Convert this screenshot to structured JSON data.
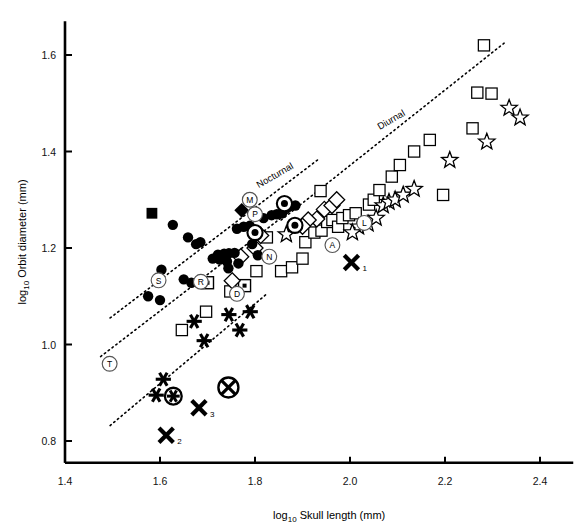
{
  "chart_data": {
    "type": "scatter",
    "title": "",
    "xlabel": "log10 Skull length (mm)",
    "xlabel_base": "log",
    "xlabel_sub": "10",
    "xlabel_rest": "Skull length (mm)",
    "ylabel_base": "log",
    "ylabel_sub": "10",
    "ylabel_rest": "Orbit diameter (mm)",
    "ylabel": "log10 Orbit diameter (mm)",
    "xlim": [
      1.4,
      2.47
    ],
    "ylim": [
      0.755,
      1.67
    ],
    "xticks": [
      1.4,
      1.6,
      1.8,
      2.0,
      2.2,
      2.4
    ],
    "xtick_labels": [
      "1.4",
      "1.6",
      "1.8",
      "2.0",
      "2.2",
      "2.4"
    ],
    "yticks": [
      0.8,
      1.0,
      1.2,
      1.4,
      1.6
    ],
    "ytick_labels": [
      "0.8",
      "1.0",
      "1.2",
      "1.4",
      "1.6"
    ],
    "grid": false,
    "legend": "none",
    "annotations": [
      {
        "text": "Diurnal",
        "x": 2.09,
        "y": 1.46,
        "rotation": -30
      },
      {
        "text": "Nocturnal",
        "x": 1.845,
        "y": 1.345,
        "rotation": -30
      }
    ],
    "trend_lines": [
      {
        "name": "upper-diurnal-line",
        "x0": 1.855,
        "y0": 1.258,
        "x1": 2.325,
        "y1": 1.625,
        "style": "dotted"
      },
      {
        "name": "middle-nocturnal-line",
        "x0": 1.495,
        "y0": 1.055,
        "x1": 1.935,
        "y1": 1.385,
        "style": "dotted"
      },
      {
        "name": "lower-line",
        "x0": 1.475,
        "y0": 0.975,
        "x1": 1.885,
        "y1": 1.285,
        "style": "dotted"
      },
      {
        "name": "bottom-line",
        "x0": 1.495,
        "y0": 0.832,
        "x1": 1.825,
        "y1": 1.105,
        "style": "dotted"
      }
    ],
    "series": [
      {
        "name": "filled-circle",
        "marker": "filled-circle",
        "points": [
          [
            1.627,
            1.248
          ],
          [
            1.659,
            1.222
          ],
          [
            1.676,
            1.208
          ],
          [
            1.685,
            1.212
          ],
          [
            1.603,
            1.155
          ],
          [
            1.65,
            1.135
          ],
          [
            1.666,
            1.128
          ],
          [
            1.711,
            1.178
          ],
          [
            1.722,
            1.186
          ],
          [
            1.735,
            1.188
          ],
          [
            1.745,
            1.189
          ],
          [
            1.757,
            1.19
          ],
          [
            1.726,
            1.176
          ],
          [
            1.741,
            1.172
          ],
          [
            1.765,
            1.168
          ],
          [
            1.744,
            1.158
          ],
          [
            1.762,
            1.24
          ],
          [
            1.776,
            1.244
          ],
          [
            1.789,
            1.246
          ],
          [
            1.8,
            1.228
          ],
          [
            1.794,
            1.208
          ],
          [
            1.806,
            1.185
          ],
          [
            1.818,
            1.262
          ],
          [
            1.835,
            1.268
          ],
          [
            1.846,
            1.27
          ],
          [
            1.857,
            1.272
          ],
          [
            1.575,
            1.1
          ],
          [
            1.6,
            1.092
          ],
          [
            1.87,
            1.285
          ],
          [
            1.885,
            1.288
          ]
        ]
      },
      {
        "name": "filled-square",
        "marker": "filled-square",
        "points": [
          [
            1.583,
            1.272
          ]
        ]
      },
      {
        "name": "filled-diamond",
        "marker": "filled-diamond",
        "points": [
          [
            1.772,
            1.278
          ]
        ]
      },
      {
        "name": "circle-with-dot",
        "marker": "circle-dot",
        "points": [
          [
            1.8,
            1.232
          ],
          [
            1.862,
            1.292
          ],
          [
            1.884,
            1.247
          ]
        ]
      },
      {
        "name": "open-square",
        "marker": "open-square",
        "points": [
          [
            1.7,
            1.128
          ],
          [
            1.748,
            1.11
          ],
          [
            1.646,
            1.03
          ],
          [
            1.697,
            1.068
          ],
          [
            1.825,
            1.222
          ],
          [
            1.855,
            1.152
          ],
          [
            1.878,
            1.16
          ],
          [
            1.9,
            1.178
          ],
          [
            1.906,
            1.212
          ],
          [
            1.925,
            1.232
          ],
          [
            1.94,
            1.236
          ],
          [
            1.952,
            1.254
          ],
          [
            1.963,
            1.258
          ],
          [
            1.975,
            1.244
          ],
          [
            1.984,
            1.262
          ],
          [
            1.998,
            1.268
          ],
          [
            2.012,
            1.272
          ],
          [
            2.04,
            1.29
          ],
          [
            2.05,
            1.3
          ],
          [
            2.062,
            1.32
          ],
          [
            2.088,
            1.348
          ],
          [
            2.105,
            1.372
          ],
          [
            2.135,
            1.4
          ],
          [
            2.168,
            1.424
          ],
          [
            2.196,
            1.31
          ],
          [
            2.258,
            1.448
          ],
          [
            2.268,
            1.522
          ],
          [
            2.298,
            1.52
          ],
          [
            2.282,
            1.62
          ],
          [
            1.803,
            1.152
          ],
          [
            1.938,
            1.318
          ]
        ]
      },
      {
        "name": "square-with-dot",
        "marker": "square-dot",
        "points": [
          [
            1.778,
            1.122
          ],
          [
            1.7,
            1.128
          ]
        ]
      },
      {
        "name": "open-diamond",
        "marker": "open-diamond",
        "points": [
          [
            1.77,
            1.182
          ],
          [
            1.8,
            1.2
          ],
          [
            1.812,
            1.226
          ],
          [
            1.752,
            1.132
          ],
          [
            1.93,
            1.26
          ],
          [
            1.946,
            1.28
          ],
          [
            1.962,
            1.288
          ],
          [
            1.972,
            1.3
          ],
          [
            1.912,
            1.258
          ],
          [
            1.9,
            1.245
          ]
        ]
      },
      {
        "name": "open-star",
        "marker": "open-star",
        "points": [
          [
            1.866,
            1.228
          ],
          [
            2.018,
            1.244
          ],
          [
            2.038,
            1.25
          ],
          [
            2.055,
            1.262
          ],
          [
            2.07,
            1.288
          ],
          [
            2.082,
            1.295
          ],
          [
            2.095,
            1.3
          ],
          [
            2.112,
            1.31
          ],
          [
            2.135,
            1.322
          ],
          [
            2.21,
            1.382
          ],
          [
            2.288,
            1.42
          ],
          [
            2.335,
            1.49
          ],
          [
            2.358,
            1.47
          ],
          [
            2.005,
            1.232
          ]
        ]
      },
      {
        "name": "asterisk",
        "marker": "asterisk",
        "points": [
          [
            1.607,
            0.928
          ],
          [
            1.592,
            0.895
          ],
          [
            1.693,
            1.008
          ],
          [
            1.745,
            1.062
          ],
          [
            1.768,
            1.03
          ],
          [
            1.79,
            1.068
          ],
          [
            1.672,
            1.048
          ]
        ]
      },
      {
        "name": "circled-asterisk",
        "marker": "circled-asterisk",
        "points": [
          [
            1.628,
            0.893
          ]
        ]
      },
      {
        "name": "circled-x",
        "marker": "circled-x",
        "points": [
          [
            1.744,
            0.911
          ]
        ]
      },
      {
        "name": "x-marker",
        "marker": "x",
        "points": [
          [
            2.003,
            1.17
          ],
          [
            1.613,
            0.812
          ],
          [
            1.682,
            0.869
          ]
        ],
        "labels": [
          "1",
          "2",
          "3"
        ]
      }
    ],
    "letter_markers": [
      {
        "letter": "M",
        "x": 1.789,
        "y": 1.3
      },
      {
        "letter": "P",
        "x": 1.8,
        "y": 1.27
      },
      {
        "letter": "S",
        "x": 1.597,
        "y": 1.133
      },
      {
        "letter": "R",
        "x": 1.686,
        "y": 1.13
      },
      {
        "letter": "T",
        "x": 1.494,
        "y": 0.96
      },
      {
        "letter": "D",
        "x": 1.762,
        "y": 1.105
      },
      {
        "letter": "N",
        "x": 1.83,
        "y": 1.182
      },
      {
        "letter": "A",
        "x": 1.963,
        "y": 1.206
      },
      {
        "letter": "L",
        "x": 2.03,
        "y": 1.252
      }
    ]
  }
}
